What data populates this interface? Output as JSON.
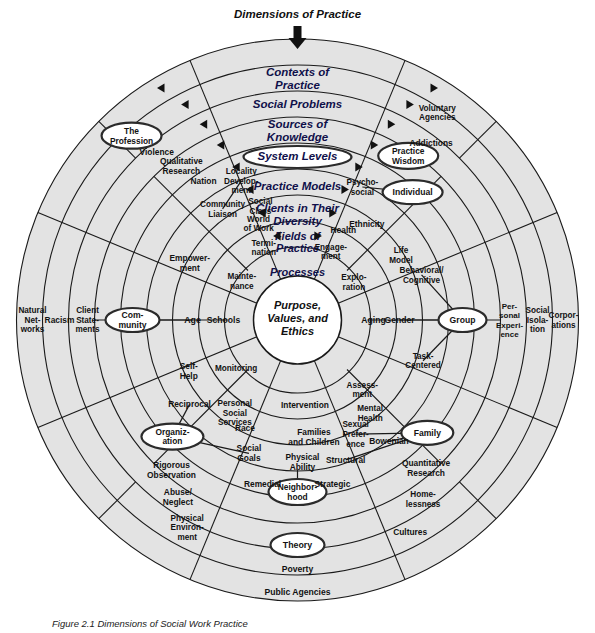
{
  "figure": {
    "top_label": "Dimensions of Practice",
    "center": [
      "Purpose,",
      "Values, and",
      "Ethics"
    ],
    "caption": "Figure 2.1  Dimensions of Social Work Practice"
  },
  "bands": [
    {
      "id": "contexts",
      "label": [
        "Contexts of",
        "Practice"
      ],
      "has_arrows": true
    },
    {
      "id": "social-problems",
      "label": [
        "Social Problems"
      ],
      "has_arrows": true
    },
    {
      "id": "sources",
      "label": [
        "Sources of",
        "Knowledge"
      ],
      "has_arrows": true
    },
    {
      "id": "system-levels",
      "label": [
        "System Levels"
      ],
      "has_arrows": true,
      "pill": true
    },
    {
      "id": "practice-models",
      "label": [
        "Practice Models"
      ],
      "has_arrows": true
    },
    {
      "id": "clients",
      "label": [
        "Clients in Their",
        "Diversity"
      ],
      "has_arrows": true
    },
    {
      "id": "fields",
      "label": [
        "Fields of",
        "Practice"
      ],
      "has_arrows": true
    },
    {
      "id": "processes",
      "label": [
        "Processes"
      ],
      "has_arrows": true
    }
  ],
  "nodes": [
    {
      "name": "the-profession",
      "label": [
        "The",
        "Profession"
      ],
      "shape": "ellipse"
    },
    {
      "name": "practice-wisdom",
      "label": [
        "Practice",
        "Wisdom"
      ],
      "shape": "ellipse"
    },
    {
      "name": "individual",
      "label": [
        "Individual"
      ],
      "shape": "ellipse"
    },
    {
      "name": "community",
      "label": [
        "Com-",
        "munity"
      ],
      "shape": "ellipse"
    },
    {
      "name": "group",
      "label": [
        "Group"
      ],
      "shape": "ellipse"
    },
    {
      "name": "organization",
      "label": [
        "Organiz-",
        "ation"
      ],
      "shape": "ellipse"
    },
    {
      "name": "family",
      "label": [
        "Family"
      ],
      "shape": "ellipse"
    },
    {
      "name": "neighborhood",
      "label": [
        "Neighbor-",
        "hood"
      ],
      "shape": "ellipse"
    },
    {
      "name": "theory",
      "label": [
        "Theory"
      ],
      "shape": "ellipse"
    },
    {
      "name": "violence",
      "label": [
        "Violence"
      ]
    },
    {
      "name": "qualitative-research",
      "label": [
        "Qualitative",
        "Research"
      ]
    },
    {
      "name": "nation",
      "label": [
        "Nation"
      ]
    },
    {
      "name": "locality-development",
      "label": [
        "Locality",
        "Develop-",
        "ment"
      ]
    },
    {
      "name": "community-liaison",
      "label": [
        "Community",
        "Liaison"
      ]
    },
    {
      "name": "social-class",
      "label": [
        "Social",
        "Class"
      ]
    },
    {
      "name": "world-of-work",
      "label": [
        "World",
        "of Work"
      ]
    },
    {
      "name": "termination",
      "label": [
        "Termi-",
        "nation"
      ]
    },
    {
      "name": "empowerment",
      "label": [
        "Empower-",
        "ment"
      ]
    },
    {
      "name": "age",
      "label": [
        "Age"
      ]
    },
    {
      "name": "schools",
      "label": [
        "Schools"
      ]
    },
    {
      "name": "maintenance",
      "label": [
        "Mainte-",
        "nance"
      ]
    },
    {
      "name": "natural-networks",
      "label": [
        "Natural",
        "Net-",
        "works"
      ]
    },
    {
      "name": "racism",
      "label": [
        "Racism"
      ]
    },
    {
      "name": "client-statements",
      "label": [
        "Client",
        "State-",
        "ments"
      ]
    },
    {
      "name": "self-help",
      "label": [
        "Self-",
        "Help"
      ]
    },
    {
      "name": "monitoring",
      "label": [
        "Monitoring"
      ]
    },
    {
      "name": "personal-social-services",
      "label": [
        "Personal",
        "Social",
        "Services"
      ]
    },
    {
      "name": "intervention",
      "label": [
        "Intervention"
      ]
    },
    {
      "name": "reciprocal",
      "label": [
        "Reciprocal"
      ]
    },
    {
      "name": "race",
      "label": [
        "Race"
      ]
    },
    {
      "name": "families-and-children",
      "label": [
        "Families",
        "and Children"
      ]
    },
    {
      "name": "rigorous-observation",
      "label": [
        "Rigorous",
        "Observation"
      ]
    },
    {
      "name": "social-goals",
      "label": [
        "Social",
        "Goals"
      ]
    },
    {
      "name": "physical-ability",
      "label": [
        "Physical",
        "Ability"
      ]
    },
    {
      "name": "abuse-neglect",
      "label": [
        "Abuse/",
        "Neglect"
      ]
    },
    {
      "name": "remedial",
      "label": [
        "Remedial"
      ]
    },
    {
      "name": "strategic",
      "label": [
        "Strategic"
      ]
    },
    {
      "name": "physical-environment",
      "label": [
        "Physical",
        "Environ-",
        "ment"
      ]
    },
    {
      "name": "poverty",
      "label": [
        "Poverty"
      ]
    },
    {
      "name": "public-agencies",
      "label": [
        "Public Agencies"
      ]
    },
    {
      "name": "bowenian",
      "label": [
        "Bowenian"
      ]
    },
    {
      "name": "quantitative-research",
      "label": [
        "Quantitative",
        "Research"
      ]
    },
    {
      "name": "homelessness",
      "label": [
        "Home-",
        "lessness"
      ]
    },
    {
      "name": "cultures",
      "label": [
        "Cultures"
      ]
    },
    {
      "name": "sexual-preference",
      "label": [
        "Sexual",
        "Prefer-",
        "ence"
      ]
    },
    {
      "name": "structural",
      "label": [
        "Structural"
      ]
    },
    {
      "name": "mental-health",
      "label": [
        "Mental",
        "Health"
      ]
    },
    {
      "name": "assessment",
      "label": [
        "Assess-",
        "ment"
      ]
    },
    {
      "name": "task-centered",
      "label": [
        "Task-",
        "Centered"
      ]
    },
    {
      "name": "behavioral-cognitive",
      "label": [
        "Behavioral/",
        "Cognitive"
      ]
    },
    {
      "name": "gender",
      "label": [
        "Gender"
      ]
    },
    {
      "name": "aging",
      "label": [
        "Aging"
      ]
    },
    {
      "name": "exploration",
      "label": [
        "Explo-",
        "ration"
      ]
    },
    {
      "name": "engagement",
      "label": [
        "Engage-",
        "ment"
      ]
    },
    {
      "name": "health",
      "label": [
        "Health"
      ]
    },
    {
      "name": "ethnicity",
      "label": [
        "Ethnicity"
      ]
    },
    {
      "name": "life-model",
      "label": [
        "Life",
        "Model"
      ]
    },
    {
      "name": "psychosocial",
      "label": [
        "Psycho-",
        "social"
      ]
    },
    {
      "name": "addictions",
      "label": [
        "Addictions"
      ]
    },
    {
      "name": "voluntary-agencies",
      "label": [
        "Voluntary",
        "Agencies"
      ]
    },
    {
      "name": "personal-experience",
      "label": [
        "Per-",
        "sonal",
        "Experi-",
        "ence"
      ]
    },
    {
      "name": "social-isolation",
      "label": [
        "Social",
        "Isola-",
        "tion"
      ]
    },
    {
      "name": "corporations",
      "label": [
        "Corpor-",
        "ations"
      ]
    }
  ],
  "colors": {
    "band_fill": "#e3e3e3",
    "stroke": "#1a1a1a",
    "band_text": "#10104a",
    "core_fill": "#ffffff"
  }
}
